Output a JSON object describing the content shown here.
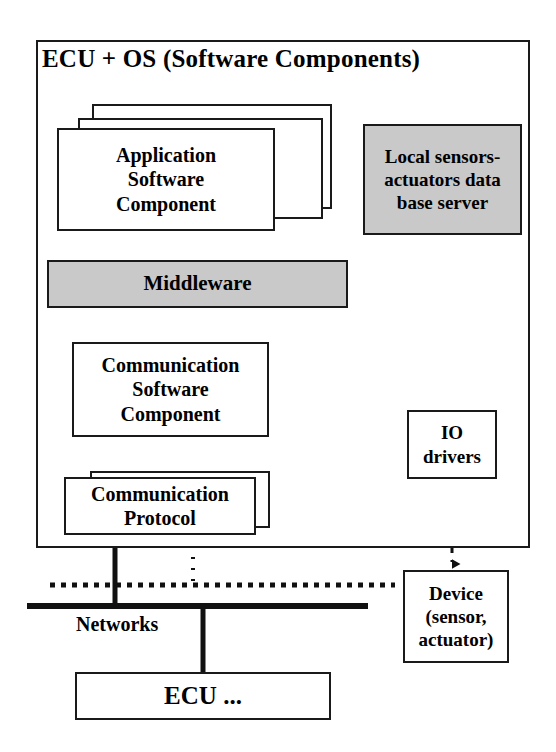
{
  "diagram": {
    "title": "ECU + OS (Software Components)",
    "container_label": "ECU + OS (Software Components)",
    "nodes": {
      "application_software_component": "Application\nSoftware\nComponent",
      "application_software_component_lines": [
        "Application",
        "Software",
        "Component"
      ],
      "local_db_server": "Local sensors-\nactuators data\nbase server",
      "local_db_server_lines": [
        "Local sensors-",
        "actuators data",
        "base server"
      ],
      "middleware": "Middleware",
      "communication_software_component": "Communication\nSoftware\nComponent",
      "communication_software_component_lines": [
        "Communication",
        "Software",
        "Component"
      ],
      "communication_protocol": "Communication\nProtocol",
      "communication_protocol_lines": [
        "Communication",
        "Protocol"
      ],
      "communication_protocol_back_partial": "on",
      "io_drivers": "IO\ndrivers",
      "io_drivers_lines": [
        "IO",
        "drivers"
      ],
      "device": "Device\n(sensor,\nactuator)",
      "device_lines": [
        "Device",
        "(sensor,",
        "actuator)"
      ],
      "networks": "Networks",
      "ecu_more": "ECU ..."
    },
    "colors": {
      "shaded_fill": "#c9c9c9",
      "stroke": "#1a1a1a",
      "background": "#ffffff",
      "text": "#000000"
    },
    "connections": [
      {
        "from": "middleware",
        "to": "application_software_component",
        "style": "double-arrow-vertical"
      },
      {
        "from": "middleware",
        "to": "local_db_server",
        "style": "double-arrow-diagonal"
      },
      {
        "from": "middleware",
        "to": "communication_software_component",
        "style": "double-arrow-vertical"
      },
      {
        "from": "communication_software_component",
        "to": "communication_protocol",
        "style": "double-arrow-vertical-left"
      },
      {
        "from": "communication_software_component",
        "to": "communication_protocol",
        "style": "double-arrow-vertical-right"
      },
      {
        "from": "local_db_server",
        "to": "io_drivers",
        "style": "double-arrow-vertical"
      },
      {
        "from": "io_drivers",
        "to": "device",
        "style": "dashed-double-arrow-vertical"
      },
      {
        "from": "communication_protocol",
        "to": "networks",
        "style": "bus-line"
      },
      {
        "from": "networks",
        "to": "ecu_more",
        "style": "bus-line"
      }
    ]
  }
}
